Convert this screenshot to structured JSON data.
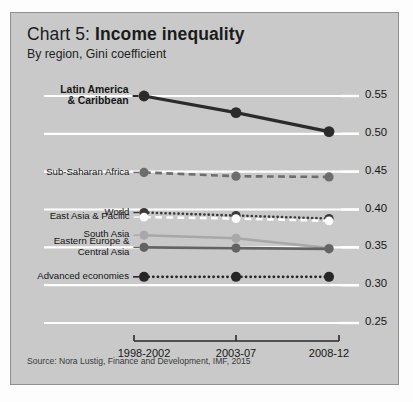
{
  "card": {
    "title_lead": "Chart 5: ",
    "title_strong": "Income inequality",
    "subtitle": "By region, Gini coefficient",
    "source": "Source: Nora Lustig, Finance and Development, IMF, 2015",
    "background": "#c9c9c9",
    "border": "#8f8f8f"
  },
  "chart_data": {
    "type": "line",
    "title": "Chart 5: Income inequality",
    "subtitle": "By region, Gini coefficient",
    "xlabel": "",
    "ylabel": "Gini coefficient",
    "categories": [
      "1998-2002",
      "2003-07",
      "2008-12"
    ],
    "ylim": [
      0.25,
      0.55
    ],
    "yticks": [
      "0.55",
      "0.50",
      "0.45",
      "0.40",
      "0.35",
      "0.30",
      "0.25"
    ],
    "ytick_values": [
      0.55,
      0.5,
      0.45,
      0.4,
      0.35,
      0.3,
      0.25
    ],
    "grid": true,
    "grid_color": "#ffffff",
    "legend": "inline-left-labels",
    "source": "Source: Nora Lustig, Finance and Development, IMF, 2015",
    "series": [
      {
        "name": "Latin America & Caribbean",
        "label_lines": [
          "Latin America",
          "& Caribbean"
        ],
        "values": [
          0.55,
          0.528,
          0.503
        ],
        "color": "#2b2b2b",
        "style": "solid",
        "width": 3.2,
        "marker": 5.4,
        "emphasis": true
      },
      {
        "name": "Sub-Saharan Africa",
        "label_lines": [
          "Sub-Saharan Africa"
        ],
        "values": [
          0.449,
          0.444,
          0.443
        ],
        "color": "#6d6d6d",
        "style": "dashed",
        "width": 2.6,
        "marker": 4.6,
        "emphasis": false
      },
      {
        "name": "World",
        "label_lines": [
          "World"
        ],
        "values": [
          0.396,
          0.392,
          0.388
        ],
        "color": "#3a3a3a",
        "style": "dotted",
        "width": 2.6,
        "marker": 4.6,
        "emphasis": false
      },
      {
        "name": "East Asia & Pacific",
        "label_lines": [
          "East Asia & Pacific"
        ],
        "values": [
          0.39,
          0.388,
          0.385
        ],
        "color": "#fbfbfb",
        "style": "dashed",
        "width": 2.6,
        "marker": 4.4,
        "emphasis": false
      },
      {
        "name": "South Asia",
        "label_lines": [
          "South Asia"
        ],
        "values": [
          0.366,
          0.362,
          0.349
        ],
        "color": "#a8a8a8",
        "style": "solid",
        "width": 2.6,
        "marker": 4.6,
        "emphasis": false
      },
      {
        "name": "Eastern Europe & Central Asia",
        "label_lines": [
          "Eastern Europe &",
          "Central Asia"
        ],
        "values": [
          0.35,
          0.349,
          0.348
        ],
        "color": "#636363",
        "style": "solid",
        "width": 2.6,
        "marker": 4.6,
        "emphasis": false
      },
      {
        "name": "Advanced economies",
        "label_lines": [
          "Advanced economies"
        ],
        "values": [
          0.311,
          0.311,
          0.311
        ],
        "color": "#262626",
        "style": "dotted",
        "width": 2.8,
        "marker": 5.0,
        "emphasis": false
      }
    ]
  }
}
